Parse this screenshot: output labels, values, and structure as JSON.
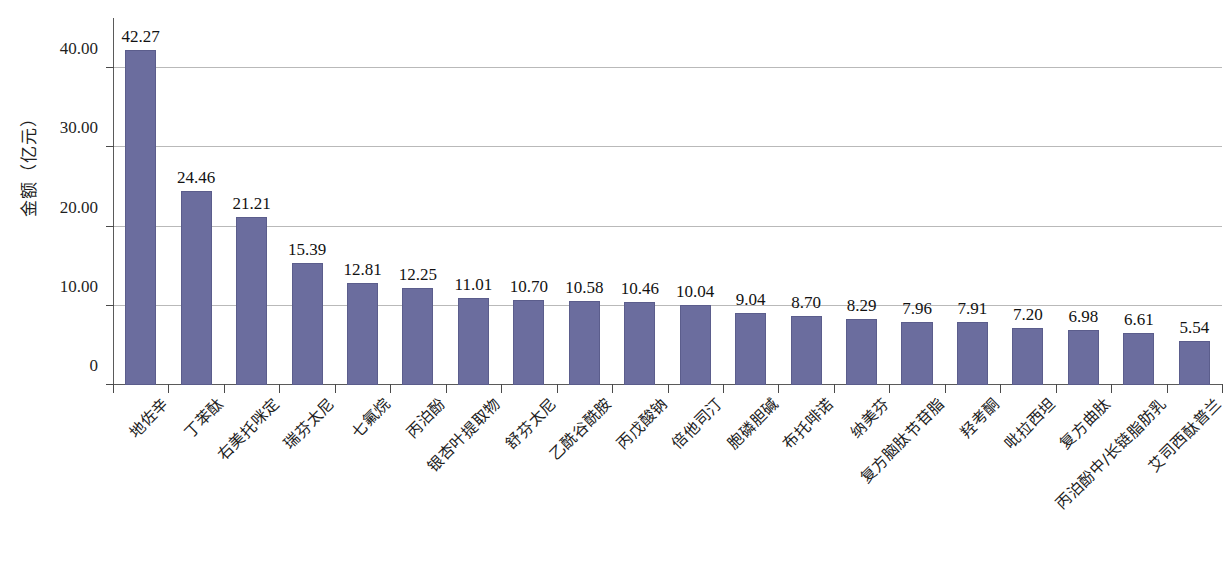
{
  "chart_data": {
    "type": "bar",
    "title": "",
    "xlabel": "",
    "ylabel": "金额（亿元）",
    "ylim": [
      0,
      45
    ],
    "yticks": [
      0,
      10,
      20,
      30,
      40
    ],
    "ytick_labels": [
      "0",
      "10.00",
      "20.00",
      "30.00",
      "40.00"
    ],
    "grid": true,
    "legend": "none",
    "categories": [
      "地佐辛",
      "丁苯酞",
      "右美托咪定",
      "瑞芬太尼",
      "七氟烷",
      "丙泊酚",
      "银杏叶提取物",
      "舒芬太尼",
      "乙酰谷酰胺",
      "丙戊酸钠",
      "倍他司汀",
      "胞磷胆碱",
      "布托啡诺",
      "纳美芬",
      "复方脑肽节苷脂",
      "羟考酮",
      "吡拉西坦",
      "复方曲肽",
      "丙泊酚中/长链脂肪乳",
      "艾司西酞普兰"
    ],
    "values": [
      42.27,
      24.46,
      21.21,
      15.39,
      12.81,
      12.25,
      11.01,
      10.7,
      10.58,
      10.46,
      10.04,
      9.04,
      8.7,
      8.29,
      7.96,
      7.91,
      7.2,
      6.98,
      6.61,
      5.54
    ],
    "value_labels": [
      "42.27",
      "24.46",
      "21.21",
      "15.39",
      "12.81",
      "12.25",
      "11.01",
      "10.70",
      "10.58",
      "10.46",
      "10.04",
      "9.04",
      "8.70",
      "8.29",
      "7.96",
      "7.91",
      "7.20",
      "6.98",
      "6.61",
      "5.54"
    ],
    "colors": {
      "bar_fill": "#6b6d9e",
      "bar_stroke": "#5b5d8c",
      "gridline": "#b9b9b9",
      "axis": "#5a5a5a",
      "text": "#1a1a1a",
      "background": "#ffffff"
    }
  }
}
